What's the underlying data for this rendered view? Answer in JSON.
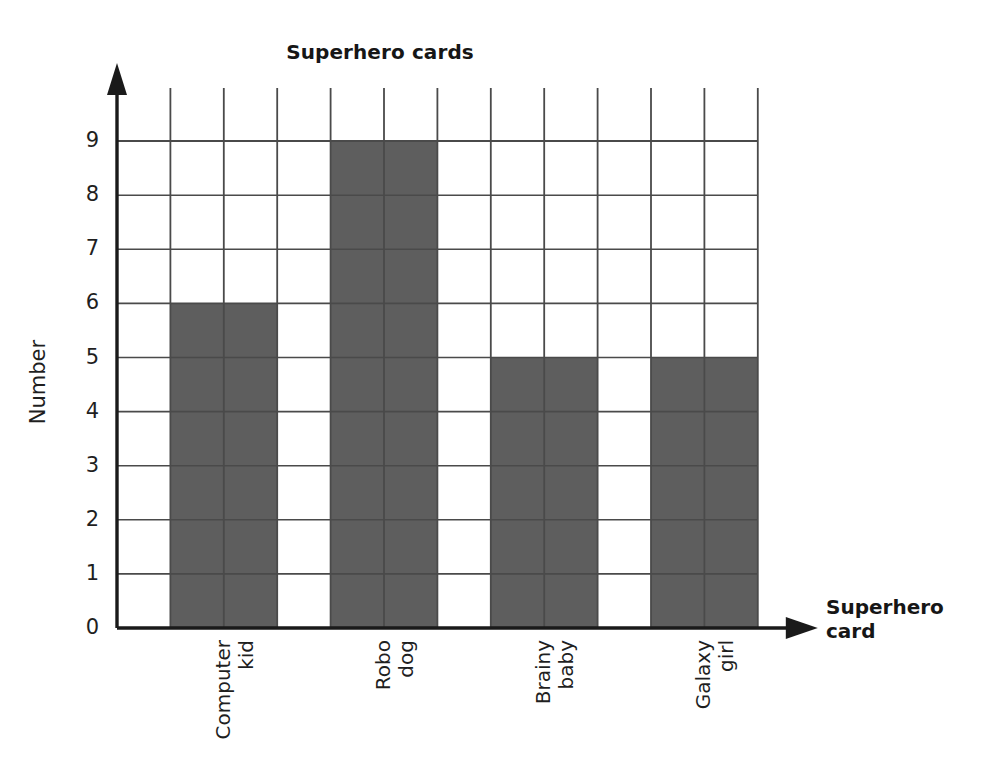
{
  "chart_data": {
    "type": "bar",
    "title": "Superhero cards",
    "xlabel": "Superhero card",
    "ylabel": "Number",
    "categories": [
      "Computer kid",
      "Robo dog",
      "Brainy baby",
      "Galaxy girl"
    ],
    "category_lines": [
      [
        "Computer",
        "kid"
      ],
      [
        "Robo",
        "dog"
      ],
      [
        "Brainy",
        "baby"
      ],
      [
        "Galaxy",
        "girl"
      ]
    ],
    "values": [
      6,
      9,
      5,
      5
    ],
    "ylim": [
      0,
      9
    ],
    "yticks": [
      "0",
      "1",
      "2",
      "3",
      "4",
      "5",
      "6",
      "7",
      "8",
      "9"
    ],
    "ytick_values": [
      0,
      1,
      2,
      3,
      4,
      5,
      6,
      7,
      8,
      9
    ],
    "grid": true,
    "legend": "none",
    "bar_color": "#5e5e5e",
    "grid_color": "#4a4a4a",
    "axis_color": "#1a1a1a",
    "background": "#ffffff"
  },
  "axis_titles": {
    "x": "Superhero\ncard",
    "y": "Number"
  }
}
